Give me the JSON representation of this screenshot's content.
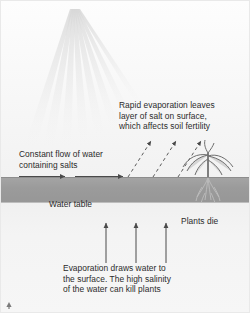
{
  "diagram": {
    "labels": {
      "rapid_evaporation": "Rapid evaporation leaves\nlayer of salt on surface,\nwhich affects soil fertility",
      "constant_flow": "Constant flow of water\ncontaining salts",
      "water_table": "Water table",
      "plants_die": "Plants die",
      "evaporation_draws": "Evaporation draws water to\nthe surface. The high salinity\nof the water can kill plants"
    },
    "icons": {
      "sun_rays": "sun-rays-icon",
      "plant": "dying-plant-icon",
      "roots": "plant-roots-icon",
      "flow_arrows": "horizontal-flow-arrow-icon",
      "evaporation_arrows": "dashed-diagonal-arrow-icon",
      "capillary_arrows": "vertical-up-arrow-icon",
      "corner_mark": "corner-arrow-mark-icon"
    },
    "colors": {
      "soil_band": "#9b9b9b",
      "subsoil": "#f3f3f3",
      "sky": "#f8f8f8",
      "arrow": "#4a4a4a",
      "text": "#2b2b2b",
      "plant": "#6f6f6f"
    },
    "counts": {
      "flow_arrows": 2,
      "evaporation_arrows": 3,
      "capillary_arrows": 3,
      "sun_rays": 8
    }
  }
}
